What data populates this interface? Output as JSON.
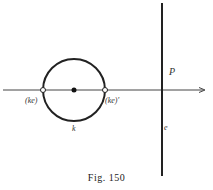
{
  "figure": {
    "caption": "Fig. 150",
    "labels": {
      "point_left": "(ke)",
      "point_right": "(ke)'",
      "circle": "k",
      "line": "e",
      "point": "P"
    },
    "colors": {
      "stroke": "#222222",
      "label": "#555555",
      "background": "#ffffff"
    },
    "geometry": {
      "axis_y": 90,
      "axis_x_start": 3,
      "axis_x_end": 205,
      "circle_center": [
        74,
        90
      ],
      "circle_radius": 31,
      "vertical_line_x": 162,
      "vertical_line_y": [
        3,
        176
      ]
    }
  }
}
